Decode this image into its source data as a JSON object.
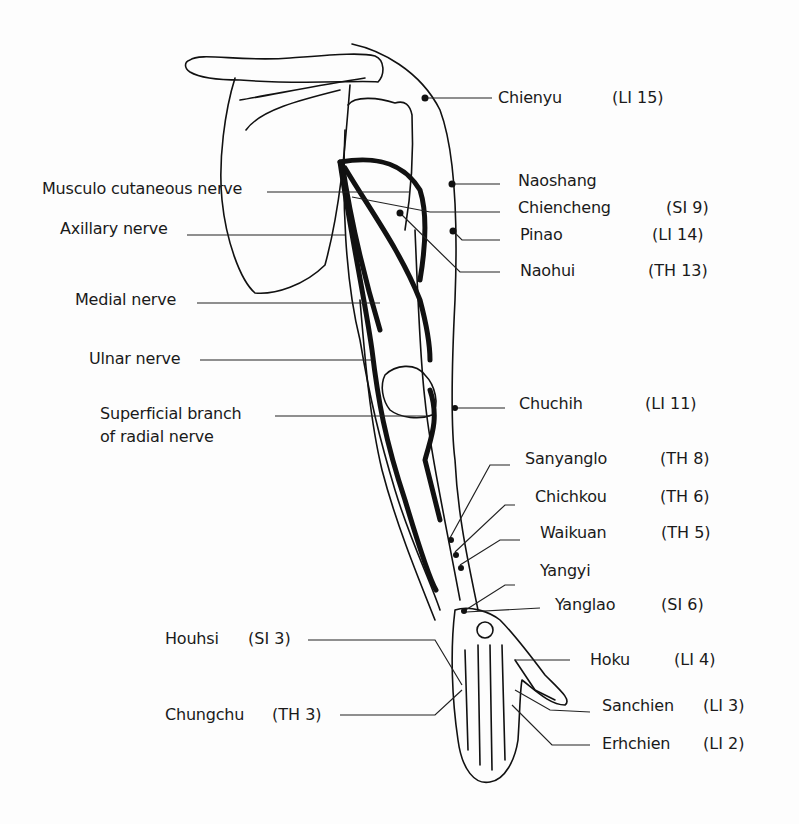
{
  "figure": {
    "nerves": [
      {
        "label": "Musculo cutaneous nerve"
      },
      {
        "label": "Axillary nerve"
      },
      {
        "label": "Medial nerve"
      },
      {
        "label": "Ulnar nerve"
      },
      {
        "label": "Superficial branch",
        "label2": "of radial nerve"
      }
    ],
    "points_right": [
      {
        "name": "Chienyu",
        "code": "(LI 15)"
      },
      {
        "name": "Naoshang",
        "code": ""
      },
      {
        "name": "Chiencheng",
        "code": "(SI 9)"
      },
      {
        "name": "Pinao",
        "code": "(LI 14)"
      },
      {
        "name": "Naohui",
        "code": "(TH 13)"
      },
      {
        "name": "Chuchih",
        "code": "(LI 11)"
      },
      {
        "name": "Sanyanglo",
        "code": "(TH 8)"
      },
      {
        "name": "Chichkou",
        "code": "(TH 6)"
      },
      {
        "name": "Waikuan",
        "code": "(TH 5)"
      },
      {
        "name": "Yangyi",
        "code": ""
      },
      {
        "name": "Yanglao",
        "code": "(SI 6)"
      },
      {
        "name": "Hoku",
        "code": "(LI 4)"
      },
      {
        "name": "Sanchien",
        "code": "(LI 3)"
      },
      {
        "name": "Erhchien",
        "code": "(LI 2)"
      }
    ],
    "points_left": [
      {
        "name": "Houhsi",
        "code": "(SI 3)"
      },
      {
        "name": "Chungchu",
        "code": "(TH 3)"
      }
    ]
  }
}
